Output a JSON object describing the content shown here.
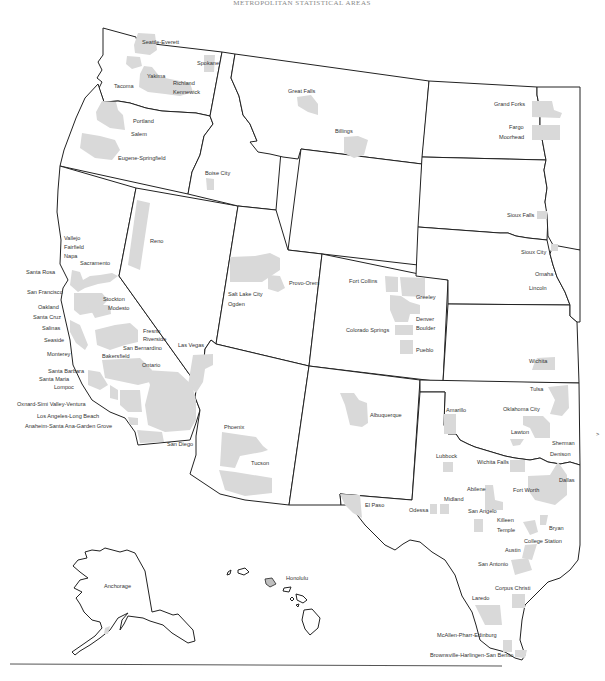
{
  "title": "METROPOLITAN STATISTICAL AREAS",
  "colors": {
    "msa_fill": "#d9d9d9",
    "state_stroke": "#222222",
    "label": "#333333",
    "background": "#ffffff"
  },
  "states": [
    "Washington",
    "Oregon",
    "California",
    "Nevada",
    "Idaho",
    "Montana",
    "Wyoming",
    "Utah",
    "Colorado",
    "Arizona",
    "New Mexico",
    "North Dakota",
    "South Dakota",
    "Nebraska",
    "Kansas",
    "Oklahoma",
    "Texas",
    "Minnesota (partial)",
    "Iowa (partial)",
    "Missouri (partial)",
    "Alaska",
    "Hawaii"
  ],
  "labels": {
    "seattle": "Seattle-Everett",
    "spokane": "Spokane",
    "yakima": "Yakima",
    "richland": "Richland",
    "kennewick": "Kennewick",
    "tacoma": "Tacoma",
    "portland": "Portland",
    "salem": "Salem",
    "eugene": "Eugene-Springfield",
    "boise": "Boise City",
    "great_falls": "Great Falls",
    "billings": "Billings",
    "grand_forks": "Grand Forks",
    "fargo": "Fargo",
    "moorhead": "Moorhead",
    "sioux_falls": "Sioux Falls",
    "sioux_city": "Sioux City",
    "omaha": "Omaha",
    "lincoln": "Lincoln",
    "reno": "Reno",
    "vallejo": "Vallejo",
    "fairfield": "Fairfield",
    "napa": "Napa",
    "sacramento": "Sacramento",
    "santa_rosa": "Santa Rosa",
    "san_francisco": "San Francisco",
    "oakland": "Oakland",
    "santa_cruz": "Santa Cruz",
    "salinas": "Salinas",
    "seaside": "Seaside",
    "monterey": "Monterey",
    "stockton": "Stockton",
    "modesto": "Modesto",
    "fresno": "Fresno",
    "riverside": "Riverside",
    "san_bernardino": "San Bernardino",
    "bakersfield": "Bakersfield",
    "ontario": "Ontario",
    "santa_barbara": "Santa Barbara",
    "santa_maria": "Santa Maria",
    "lompoc": "Lompoc",
    "oxnard": "Oxnard-Simi Valley-Ventura",
    "los_angeles": "Los Angeles-Long Beach",
    "anaheim": "Anaheim-Santa Ana-Garden Grove",
    "san_diego": "San Diego",
    "las_vegas": "Las Vegas",
    "salt_lake": "Salt Lake City",
    "ogden": "Ogden",
    "provo": "Provo-Orem",
    "fort_collins": "Fort Collins",
    "greeley": "Greeley",
    "denver": "Denver",
    "boulder": "Boulder",
    "colorado_springs": "Colorado Springs",
    "pueblo": "Pueblo",
    "wichita": "Wichita",
    "phoenix": "Phoenix",
    "tucson": "Tucson",
    "albuquerque": "Albuquerque",
    "el_paso": "El Paso",
    "tulsa": "Tulsa",
    "oklahoma_city": "Oklahoma City",
    "lawton": "Lawton",
    "sherman": "Sherman",
    "denison": "Denison",
    "amarillo": "Amarillo",
    "lubbock": "Lubbock",
    "wichita_falls": "Wichita Falls",
    "dallas": "Dallas",
    "fort_worth": "Fort Worth",
    "abilene": "Abilene",
    "midland": "Midland",
    "odessa": "Odessa",
    "san_angelo": "San Angelo",
    "killeen": "Killeen",
    "temple": "Temple",
    "bryan": "Bryan",
    "college_station": "College Station",
    "austin": "Austin",
    "san_antonio": "San Antonio",
    "corpus_christi": "Corpus Christi",
    "laredo": "Laredo",
    "mcallen": "McAllen-Pharr-Edinburg",
    "brownsville": "Brownsville-Harlingen-San Benito",
    "anchorage": "Anchorage",
    "honolulu": "Honolulu"
  }
}
